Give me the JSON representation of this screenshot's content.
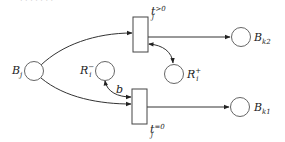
{
  "diagram": {
    "type": "petri-net",
    "places": [
      {
        "id": "Bj",
        "label": "B",
        "sub": "j",
        "sup": ""
      },
      {
        "id": "Ri_minus",
        "label": "R",
        "sub": "i",
        "sup": "−"
      },
      {
        "id": "Ri_plus",
        "label": "R",
        "sub": "i",
        "sup": "+"
      },
      {
        "id": "Bk2",
        "label": "B",
        "sub": "k2",
        "sup": ""
      },
      {
        "id": "Bk1",
        "label": "B",
        "sub": "k1",
        "sup": ""
      }
    ],
    "transitions": [
      {
        "id": "tj_gt0",
        "label": "t",
        "sub": "j",
        "sup": ">0"
      },
      {
        "id": "tj_eq0",
        "label": "t",
        "sub": "j",
        "sup": "=0"
      }
    ],
    "arcs": [
      {
        "from": "Bj",
        "to": "tj_gt0",
        "label": ""
      },
      {
        "from": "Bj",
        "to": "tj_eq0",
        "label": ""
      },
      {
        "from": "tj_gt0",
        "to": "Bk2",
        "label": ""
      },
      {
        "from": "tj_eq0",
        "to": "Bk1",
        "label": ""
      },
      {
        "from": "tj_gt0",
        "to": "Ri_plus",
        "label": "",
        "bidirectional": true
      },
      {
        "from": "Ri_minus",
        "to": "tj_eq0",
        "label": "b",
        "bidirectional": true
      }
    ],
    "arc_label_b": "b"
  }
}
